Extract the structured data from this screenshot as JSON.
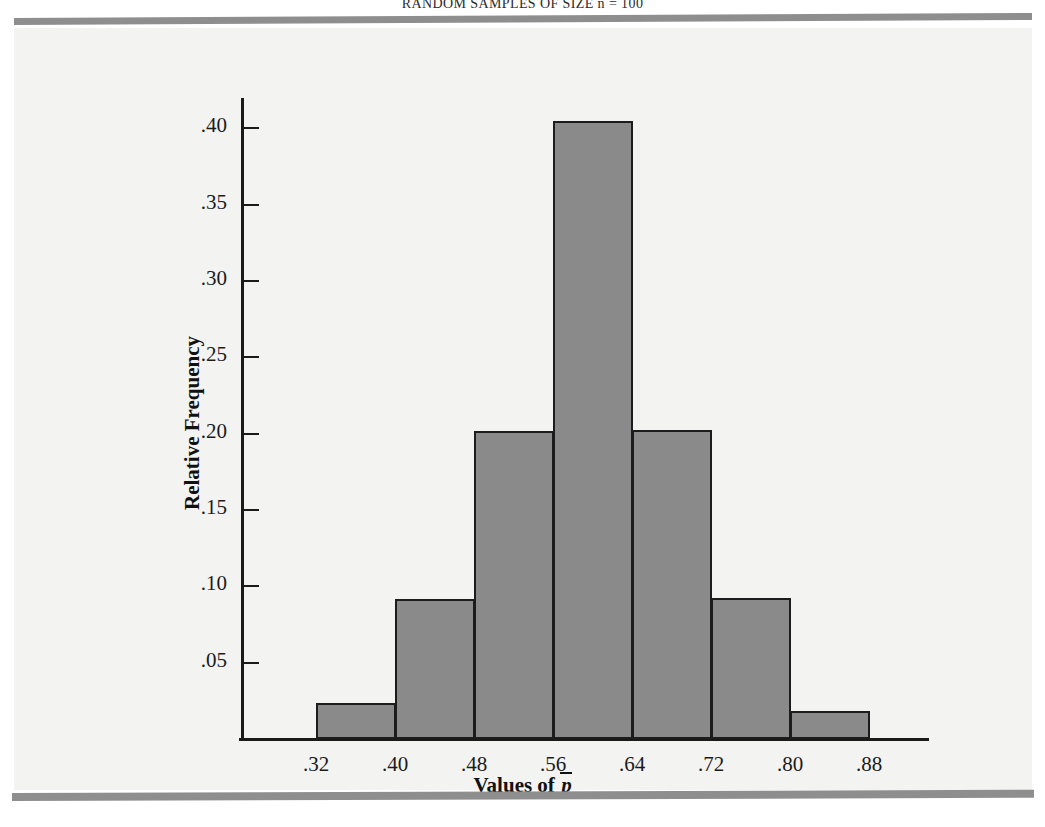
{
  "page": {
    "running_head": "RANDOM SAMPLES OF SIZE n = 100",
    "panel_background": "#f3f3f1",
    "rule_color": "#8e8e8e"
  },
  "figure": {
    "axis_title_x_prefix": "Values of ",
    "axis_title_x_symbol": "p",
    "axis_title_y": "Relative Frequency",
    "bar_fill_color": "#8a8a8a",
    "bar_edge_color": "#1c1c1c",
    "axis_color": "#1a1a1a"
  },
  "chart_data": {
    "type": "bar",
    "title": "RANDOM SAMPLES OF SIZE n = 100",
    "xlabel": "Values of p̄",
    "ylabel": "Relative Frequency",
    "grid": false,
    "legend": false,
    "xlim": [
      0.32,
      0.88
    ],
    "ylim": [
      0,
      0.42
    ],
    "bin_edges": [
      0.32,
      0.4,
      0.48,
      0.56,
      0.64,
      0.72,
      0.8,
      0.88
    ],
    "xticks": [
      ".32",
      ".40",
      ".48",
      ".56",
      ".64",
      ".72",
      ".80",
      ".88"
    ],
    "yticks": [
      ".05",
      ".10",
      ".15",
      ".20",
      ".25",
      ".30",
      ".35",
      ".40"
    ],
    "ytick_values": [
      0.05,
      0.1,
      0.15,
      0.2,
      0.25,
      0.3,
      0.35,
      0.4
    ],
    "categories": [
      "0.32-0.40",
      "0.40-0.48",
      "0.48-0.56",
      "0.56-0.64",
      "0.64-0.72",
      "0.72-0.80",
      "0.80-0.88"
    ],
    "values": [
      0.023,
      0.091,
      0.201,
      0.404,
      0.202,
      0.092,
      0.018
    ]
  }
}
